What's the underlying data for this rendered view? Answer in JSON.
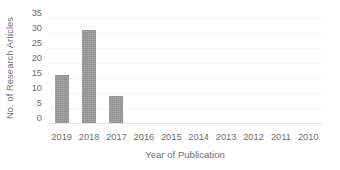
{
  "chart_data": {
    "type": "bar",
    "title": "",
    "xlabel": "Year of Publication",
    "ylabel": "No. of Research Articles",
    "categories": [
      "2019",
      "2018",
      "2017",
      "2016",
      "2015",
      "2014",
      "2013",
      "2012",
      "2011",
      "2010"
    ],
    "values": [
      16,
      31,
      9,
      0,
      0,
      0,
      0,
      0,
      0,
      0
    ],
    "ylim": [
      0,
      35
    ],
    "yticks": [
      "35",
      "30",
      "25",
      "20",
      "15",
      "10",
      "5",
      "0"
    ],
    "ytick_values": [
      35,
      30,
      25,
      20,
      15,
      10,
      5,
      0
    ],
    "ytick_step": 5,
    "grid": true,
    "grid_axis": "y",
    "legend": false,
    "legend_position": "none",
    "series": [
      {
        "name": "No. of Research Articles",
        "values": [
          16,
          31,
          9,
          0,
          0,
          0,
          0,
          0,
          0,
          0
        ]
      }
    ],
    "colors": {
      "bar_fill": "#9a9a9a",
      "gridline": "#f4f4f4",
      "axis_line": "#e3e3e3",
      "text": "#6f6f6f",
      "background": "#ffffff"
    }
  }
}
